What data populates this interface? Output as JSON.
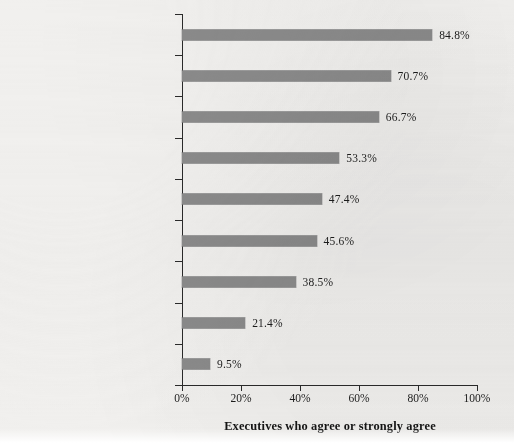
{
  "chart_data": {
    "type": "bar",
    "orientation": "horizontal",
    "title": "",
    "xlabel": "Executives who agree or strongly agree",
    "ylabel": "",
    "xlim": [
      0,
      100
    ],
    "grid": false,
    "legend": false,
    "bar_color": "#8b8b8b",
    "background_color": "#f1f0ee",
    "axis_color": "#2a2a2a",
    "xticks": [
      "0%",
      "20%",
      "40%",
      "60%",
      "80%",
      "100%"
    ],
    "xtick_values": [
      0,
      20,
      40,
      60,
      80,
      100
    ],
    "categories": [
      "Maintaining consistency with our\nhistoric dividend policy",
      "Stability of future earnings",
      "A sustainable change in earnings",
      "Attracting institutional investors to\npurchase our stock",
      "The availability of good investment\nopportunities for our firm to pursue",
      "Attracting retail investors to\npurchase our stock",
      "The dividend policies of competitors\nor other companies in our industry",
      "Personal taxes our stockholders\npay when receiving dividends",
      "Flotation costs to issuing additional\nequity"
    ],
    "values": [
      84.8,
      70.7,
      66.7,
      53.3,
      47.4,
      45.6,
      38.5,
      21.4,
      9.5
    ],
    "value_labels": [
      "84.8%",
      "70.7%",
      "66.7%",
      "53.3%",
      "47.4%",
      "45.6%",
      "38.5%",
      "21.4%",
      "9.5%"
    ]
  }
}
